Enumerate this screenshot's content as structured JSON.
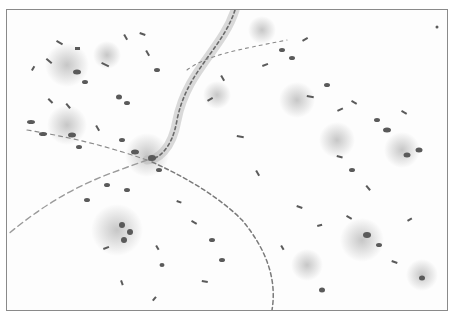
{
  "image": {
    "kind": "micrograph",
    "description": "Grayscale light-microscopy image of stained tissue showing elongated cell nuclei scattered across a pale background, with a branching vessel-like structure lined with nuclei running from top center down to the bottom center and sweeping left.",
    "colors": {
      "background": "#fdfdfd",
      "border": "#8a8a8a",
      "nucleus": "#5a5a5a",
      "glow": "#9a9a9a"
    }
  }
}
